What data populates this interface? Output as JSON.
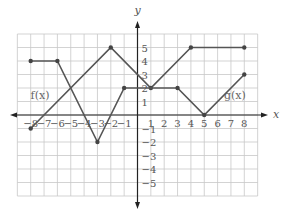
{
  "chart_data": {
    "type": "line",
    "title": "",
    "xlabel": "x",
    "ylabel": "y",
    "xlim": [
      -9,
      9
    ],
    "ylim": [
      -6,
      6
    ],
    "grid": true,
    "x_ticks": [
      -8,
      -7,
      -6,
      -5,
      -4,
      -3,
      -2,
      -1,
      1,
      2,
      3,
      4,
      5,
      6,
      7,
      8
    ],
    "y_ticks": [
      -5,
      -4,
      -3,
      -2,
      -1,
      1,
      2,
      3,
      4,
      5
    ],
    "series": [
      {
        "name": "f(x)",
        "points": [
          [
            -8,
            -1
          ],
          [
            -2,
            5
          ],
          [
            1,
            2
          ],
          [
            4,
            5
          ],
          [
            8,
            5
          ]
        ]
      },
      {
        "name": "g(x)",
        "points": [
          [
            -8,
            4
          ],
          [
            -6,
            4
          ],
          [
            -3,
            -2
          ],
          [
            -1,
            2
          ],
          [
            3,
            2
          ],
          [
            5,
            0
          ],
          [
            8,
            3
          ]
        ]
      }
    ],
    "annotations": [
      {
        "text": "f(x)",
        "x": -7.3,
        "y": 1.5
      },
      {
        "text": "g(x)",
        "x": 7.3,
        "y": 1.5
      }
    ]
  },
  "colors": {
    "grid": "#c8c8c8",
    "axis": "#222222",
    "line": "#555555",
    "point": "#444444"
  }
}
